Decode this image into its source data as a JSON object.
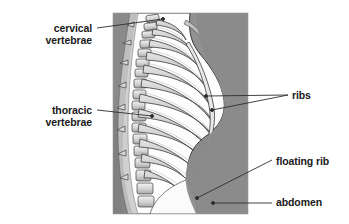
{
  "figure": {
    "type": "anatomical-illustration",
    "background_color": "#ffffff",
    "panel": {
      "x": 113,
      "y": 13,
      "width": 135,
      "height": 201,
      "background_color": "#8f8f8f",
      "body_color": "#fdfdfd",
      "bone_color": "#cfcfcf",
      "bone_shadow_color": "#9a9a9a",
      "outline_color": "#2b2b2b"
    }
  },
  "labels": [
    {
      "id": "cervical",
      "text": "cervical\nvertebrae",
      "line1": "cervical",
      "line2": "vertebrae",
      "align": "right",
      "color": "#1a1a1a",
      "leader": {
        "from_x": 97,
        "from_y": 28,
        "to_x": 163,
        "to_y": 19
      }
    },
    {
      "id": "thoracic",
      "text": "thoracic\nvertebrae",
      "line1": "thoracic",
      "line2": "vertebrae",
      "align": "right",
      "color": "#1a1a1a",
      "leader": {
        "from_x": 97,
        "from_y": 110,
        "to_x": 152,
        "to_y": 116
      }
    },
    {
      "id": "ribs",
      "text": "ribs",
      "line1": "ribs",
      "align": "left",
      "color": "#1a1a1a",
      "leader_a": {
        "from_x": 288,
        "from_y": 95,
        "to_x": 206,
        "to_y": 96
      },
      "leader_b": {
        "from_x": 288,
        "from_y": 95,
        "to_x": 212,
        "to_y": 110
      }
    },
    {
      "id": "floating-rib",
      "text": "floating rib",
      "line1": "floating rib",
      "align": "left",
      "color": "#1a1a1a",
      "leader": {
        "from_x": 272,
        "from_y": 160,
        "to_x": 197,
        "to_y": 198
      }
    },
    {
      "id": "abdomen",
      "text": "abdomen",
      "line1": "abdomen",
      "align": "left",
      "color": "#1a1a1a",
      "leader": {
        "from_x": 272,
        "from_y": 203,
        "to_x": 213,
        "to_y": 203
      }
    }
  ],
  "anatomy": {
    "rib_count_visible": 12,
    "parts": [
      "cervical vertebrae",
      "thoracic vertebrae",
      "ribs",
      "floating rib",
      "abdomen",
      "sternum",
      "costal cartilage"
    ]
  }
}
